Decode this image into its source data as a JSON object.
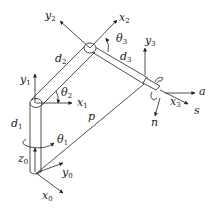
{
  "diagram": {
    "type": "robot-manipulator-kinematics",
    "colors": {
      "stroke": "#222222",
      "background": "#ffffff"
    },
    "labels": {
      "y2": {
        "base": "y",
        "sub": "2"
      },
      "x2": {
        "base": "x",
        "sub": "2"
      },
      "theta3": {
        "base": "θ",
        "sub": "3"
      },
      "d2": {
        "base": "d",
        "sub": "2"
      },
      "d3": {
        "base": "d",
        "sub": "3"
      },
      "y3": {
        "base": "y",
        "sub": "3"
      },
      "y1": {
        "base": "y",
        "sub": "1"
      },
      "theta2": {
        "base": "θ",
        "sub": "2"
      },
      "x1": {
        "base": "x",
        "sub": "1"
      },
      "a": {
        "base": "a",
        "sub": ""
      },
      "x3": {
        "base": "x",
        "sub": "3"
      },
      "s": {
        "base": "s",
        "sub": ""
      },
      "n": {
        "base": "n",
        "sub": ""
      },
      "p": {
        "base": "p",
        "sub": ""
      },
      "d1": {
        "base": "d",
        "sub": "1"
      },
      "theta1": {
        "base": "θ",
        "sub": "1"
      },
      "z0": {
        "base": "z",
        "sub": "0"
      },
      "y0": {
        "base": "y",
        "sub": "0"
      },
      "x0": {
        "base": "x",
        "sub": "0"
      }
    }
  }
}
